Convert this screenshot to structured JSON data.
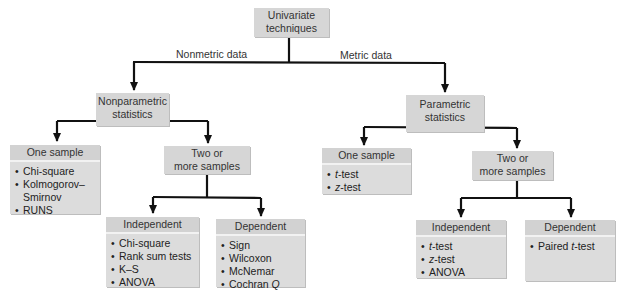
{
  "root": {
    "line1": "Univariate",
    "line2": "techniques"
  },
  "branches": {
    "left_label": "Nonmetric data",
    "right_label": "Metric data"
  },
  "nonparametric": {
    "line1": "Nonparametric",
    "line2": "statistics",
    "one_sample": {
      "title": "One sample",
      "items": [
        "Chi-square",
        "Kolmogorov–",
        "Smirnov",
        "RUNS"
      ]
    },
    "two_or_more": {
      "line1": "Two or",
      "line2": "more samples"
    },
    "independent": {
      "title": "Independent",
      "items": [
        "Chi-square",
        "Rank sum tests",
        "K–S",
        "ANOVA"
      ]
    },
    "dependent": {
      "title": "Dependent",
      "items": [
        "Sign",
        "Wilcoxon",
        "McNemar",
        "Cochran ",
        "Q"
      ]
    }
  },
  "parametric": {
    "line1": "Parametric",
    "line2": "statistics",
    "one_sample": {
      "title": "One sample",
      "items": [
        "t",
        "-test",
        "z",
        "-test"
      ]
    },
    "two_or_more": {
      "line1": "Two or",
      "line2": "more samples"
    },
    "independent": {
      "title": "Independent",
      "items": [
        "t",
        "-test",
        "z",
        "-test",
        "ANOVA"
      ]
    },
    "dependent": {
      "title": "Dependent",
      "items": [
        "Paired ",
        "t",
        "-test"
      ]
    }
  },
  "bullet": "•",
  "colors": {
    "box_fill": "#d6d6d6",
    "line": "#111111"
  }
}
